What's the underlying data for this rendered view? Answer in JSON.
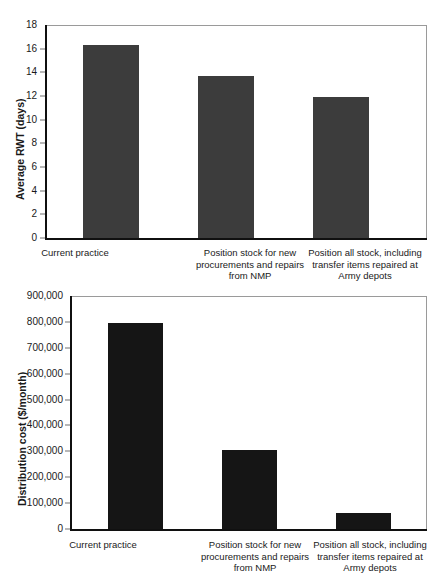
{
  "chart_data": [
    {
      "id": "average-rwt",
      "type": "bar",
      "title": "",
      "xlabel": "",
      "ylabel": "Average RWT (days)",
      "ylim": [
        0,
        18
      ],
      "ytick_step": 2,
      "grid": false,
      "legend": "none",
      "bar_color": "#3c3c3c",
      "yticks": [
        "18",
        "16",
        "14",
        "12",
        "10",
        "8",
        "6",
        "4",
        "2",
        "0"
      ],
      "categories": [
        "Current practice",
        "Position stock for new procurements and repairs from NMP",
        "Position all stock, including transfer items repaired at Army depots"
      ],
      "category_lines": [
        [
          "Current practice"
        ],
        [
          "Position stock for new",
          "procurements and repairs",
          "from NMP"
        ],
        [
          "Position all stock, including",
          "transfer items repaired at",
          "Army depots"
        ]
      ],
      "values": [
        16.3,
        13.65,
        11.95
      ]
    },
    {
      "id": "distribution-cost",
      "type": "bar",
      "title": "",
      "xlabel": "",
      "ylabel": "Distribution cost ($/month)",
      "ylim": [
        0,
        900000
      ],
      "ytick_step": 100000,
      "grid": false,
      "legend": "none",
      "bar_color": "#151515",
      "yticks": [
        "900,000",
        "800,000",
        "700,000",
        "600,000",
        "500,000",
        "400,000",
        "300,000",
        "200,000",
        "100,000",
        "0"
      ],
      "categories": [
        "Current practice",
        "Position stock for new procurements and repairs from NMP",
        "Position all stock, including transfer items repaired at Army depots"
      ],
      "category_lines": [
        [
          "Current practice"
        ],
        [
          "Position stock for new",
          "procurements and repairs",
          "from NMP"
        ],
        [
          "Position all stock, including",
          "transfer items repaired at",
          "Army depots"
        ]
      ],
      "values": [
        795000,
        305000,
        63000
      ]
    }
  ]
}
